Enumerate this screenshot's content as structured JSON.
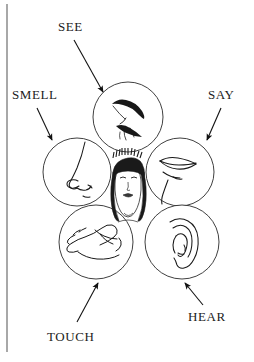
{
  "page": {
    "background_color": "#ffffff",
    "ink_color": "#1b1b1b",
    "width": 254,
    "height": 362
  },
  "edge_rule": {
    "name": "page-gutter-line",
    "color": "#a8a8a8"
  },
  "center_figure": {
    "name": "womans-face",
    "description": "womans-face-illustration"
  },
  "senses": [
    {
      "id": "see",
      "label": "SEE",
      "icon": "eye-icon",
      "circle": {
        "cx": 128,
        "cy": 117,
        "r": 35
      },
      "arrow": {
        "x1": 74,
        "y1": 40,
        "x2": 103,
        "y2": 92
      }
    },
    {
      "id": "smell",
      "label": "SMELL",
      "icon": "nose-icon",
      "circle": {
        "cx": 77,
        "cy": 172,
        "r": 34
      },
      "arrow": {
        "x1": 37,
        "y1": 108,
        "x2": 52,
        "y2": 140
      }
    },
    {
      "id": "say",
      "label": "SAY",
      "icon": "lips-icon",
      "circle": {
        "cx": 180,
        "cy": 172,
        "r": 34
      },
      "arrow": {
        "x1": 221,
        "y1": 108,
        "x2": 207,
        "y2": 140
      }
    },
    {
      "id": "touch",
      "label": "TOUCH",
      "icon": "hand-icon",
      "circle": {
        "cx": 96,
        "cy": 242,
        "r": 37
      },
      "arrow": {
        "x1": 77,
        "y1": 322,
        "x2": 98,
        "y2": 283
      }
    },
    {
      "id": "hear",
      "label": "HEAR",
      "icon": "ear-icon",
      "circle": {
        "cx": 182,
        "cy": 242,
        "r": 37
      },
      "arrow": {
        "x1": 203,
        "y1": 305,
        "x2": 185,
        "y2": 283
      }
    }
  ]
}
